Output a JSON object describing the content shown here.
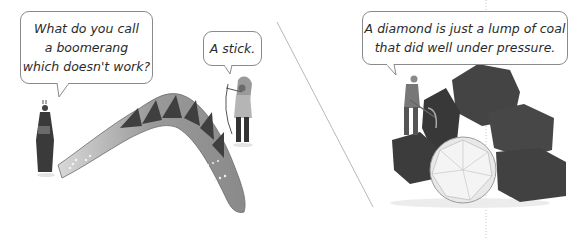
{
  "panels": {
    "left": {
      "joke": {
        "question_lines": [
          "What do you call",
          "a boomerang",
          "which doesn't work?"
        ],
        "answer": "A stick."
      },
      "illustration": {
        "objects": [
          "boomerang",
          "figure-left-speaker",
          "figure-right-speaker-with-bow"
        ]
      }
    },
    "right": {
      "joke": {
        "lines": [
          "A diamond is just a lump of coal",
          "that did well under pressure."
        ]
      },
      "illustration": {
        "objects": [
          "coal-pile",
          "diamond",
          "miner-with-pickaxe"
        ]
      }
    }
  },
  "colors": {
    "bubble_border": "#8a8a8a",
    "text": "#2a2a2a",
    "divider": "#b8b8b8",
    "coal": "#3a3a3a",
    "boomerang_light": "#b5b5b5",
    "boomerang_dark": "#4a4a4a"
  }
}
